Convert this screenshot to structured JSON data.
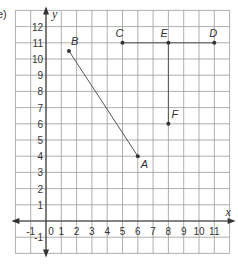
{
  "question_label": "e)",
  "chart_data": {
    "type": "scatter",
    "title": "",
    "xlabel": "x",
    "ylabel": "y",
    "xlim": [
      -2,
      12
    ],
    "ylim": [
      -2,
      13
    ],
    "grid": true,
    "x_ticks": [
      "-1",
      "0",
      "1",
      "2",
      "3",
      "4",
      "5",
      "6",
      "7",
      "8",
      "9",
      "10",
      "11"
    ],
    "y_ticks": [
      "-1",
      "1",
      "2",
      "3",
      "4",
      "5",
      "6",
      "7",
      "8",
      "9",
      "10",
      "11",
      "12"
    ],
    "points": [
      {
        "label": "A",
        "x": 6,
        "y": 4
      },
      {
        "label": "B",
        "x": 1.5,
        "y": 10.5
      },
      {
        "label": "C",
        "x": 5,
        "y": 11
      },
      {
        "label": "D",
        "x": 11,
        "y": 11
      },
      {
        "label": "E",
        "x": 8,
        "y": 11
      },
      {
        "label": "F",
        "x": 8,
        "y": 6
      }
    ],
    "segments": [
      {
        "from": "B",
        "to": "A"
      },
      {
        "from": "C",
        "to": "D"
      },
      {
        "from": "E",
        "to": "F"
      }
    ]
  },
  "colors": {
    "grid": "#9a9a9a",
    "axis": "#333333",
    "line": "#555555",
    "point": "#333333"
  }
}
